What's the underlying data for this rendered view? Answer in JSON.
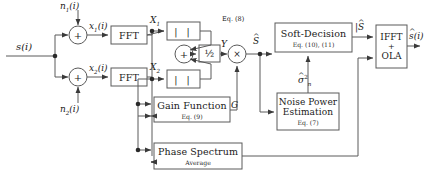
{
  "diagram": {
    "type": "signal-processing-block-diagram",
    "width": 424,
    "height": 184,
    "stroke_color": "#5a5a5a",
    "text_color": "#1a1a1a",
    "background": "#ffffff"
  },
  "signals": {
    "input_clean": "s(i)",
    "noise_1": "n1(i)",
    "noise_2": "n2(i)",
    "noisy_1": "x1(i)",
    "noisy_2": "x2(i)",
    "spectrum_1": "X1",
    "spectrum_2": "X2",
    "averaged_mag": "Y",
    "estimated_spectrum": "S",
    "soft_decision_out": "|S|",
    "gain": "G",
    "noise_power": "sigma_n^2",
    "output": "s(i)"
  },
  "labels": {
    "n1": {
      "base": "n",
      "sub": "1",
      "arg": "(i)"
    },
    "n2": {
      "base": "n",
      "sub": "2",
      "arg": "(i)"
    },
    "s_in": {
      "base": "s",
      "arg": "(i)"
    },
    "x1": {
      "base": "x",
      "sub": "1",
      "arg": "(i)"
    },
    "x2": {
      "base": "x",
      "sub": "2",
      "arg": "(i)"
    },
    "X1": {
      "base": "X",
      "sub": "1"
    },
    "X2": {
      "base": "X",
      "sub": "2"
    },
    "Y": {
      "base": "Y"
    },
    "S_hat": {
      "base": "S",
      "hat": "^"
    },
    "S_hat_bars": {
      "base": "S",
      "hat": "^",
      "bars": "| |"
    },
    "G": {
      "base": "G"
    },
    "sigma": {
      "base": "σ",
      "hat": "^",
      "sup": "2",
      "sub": "n"
    },
    "s_out": {
      "base": "s",
      "hat": "^",
      "arg": "(i)"
    },
    "eq8": "Eq. (8)"
  },
  "blocks": [
    {
      "id": "fft1",
      "main": "FFT",
      "sub": ""
    },
    {
      "id": "fft2",
      "main": "FFT",
      "sub": ""
    },
    {
      "id": "mag1",
      "main": "| |",
      "sub": ""
    },
    {
      "id": "mag2",
      "main": "| |",
      "sub": ""
    },
    {
      "id": "half",
      "main": "½",
      "sub": ""
    },
    {
      "id": "soft",
      "main": "Soft-Decision",
      "sub": "Eq. (10), (11)"
    },
    {
      "id": "ifft",
      "main": "IFFT + OLA",
      "sub": ""
    },
    {
      "id": "gain",
      "main": "Gain Function",
      "sub": "Eq. (9)"
    },
    {
      "id": "noise",
      "main": "Noise Power Estimation",
      "sub": "Eq. (7)"
    },
    {
      "id": "phase",
      "main": "Phase Spectrum",
      "sub": "Average"
    }
  ],
  "block_text": {
    "fft1_main": "FFT",
    "fft2_main": "FFT",
    "mag1_main": "| |",
    "mag2_main": "| |",
    "half_main": "½",
    "soft_main": "Soft-Decision",
    "soft_sub": "Eq. (10), (11)",
    "ifft_line1": "IFFT",
    "ifft_line2": "+",
    "ifft_line3": "OLA",
    "gain_main": "Gain Function",
    "gain_sub": "Eq. (9)",
    "noise_line1": "Noise Power",
    "noise_line2": "Estimation",
    "noise_sub": "Eq. (7)",
    "phase_main": "Phase Spectrum",
    "phase_sub": "Average"
  },
  "operators": {
    "sum1": "+",
    "sum2": "+",
    "sum3": "+",
    "mult": "×"
  },
  "annotations": {
    "eq8": "Eq. (8)"
  }
}
